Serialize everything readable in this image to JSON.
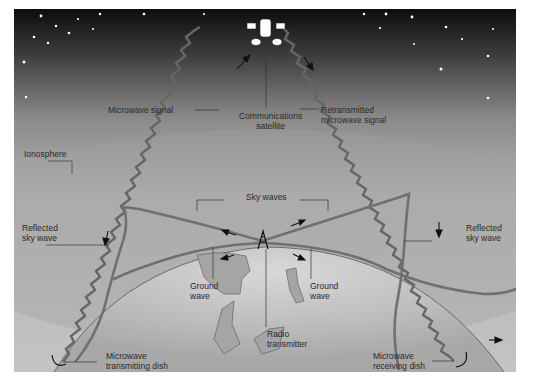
{
  "figure": {
    "colors": {
      "sky_top": "#0d0d0d",
      "sky_mid": "#6e6e6e",
      "atmosphere": "#bdbdbd",
      "earth": "#cfcfcf",
      "land": "#9a9a9a",
      "wave": "#6a6a6a",
      "leader_line": "#333333"
    },
    "labels": {
      "satellite": [
        "Communications",
        "satellite"
      ],
      "microwave_signal": "Microwave signal",
      "retransmitted": [
        "Retransmitted",
        "microwave signal"
      ],
      "ionosphere": "Ionosphere",
      "sky_waves": "Sky waves",
      "reflected_left": [
        "Reflected",
        "sky wave"
      ],
      "reflected_right": [
        "Reflected",
        "sky wave"
      ],
      "ground_wave_left": [
        "Ground",
        "wave"
      ],
      "ground_wave_right": [
        "Ground",
        "wave"
      ],
      "tx_dish": [
        "Microwave",
        "transmitting dish"
      ],
      "radio_tx": [
        "Radio",
        "transmitter"
      ],
      "rx_dish": [
        "Microwave",
        "receiving dish"
      ]
    }
  }
}
